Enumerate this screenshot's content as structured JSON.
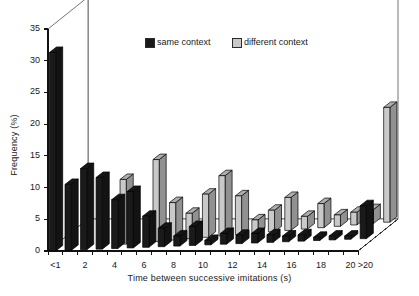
{
  "chart_data": {
    "type": "bar",
    "title": "",
    "xlabel": "Time between successive imitations (s)",
    "ylabel": "Frequency (%)",
    "ylim": [
      0,
      35
    ],
    "yticks": [
      0,
      5,
      10,
      15,
      20,
      25,
      30,
      35
    ],
    "xtick_labels": [
      "<1",
      "2",
      "4",
      "6",
      "8",
      "10",
      "12",
      "14",
      "16",
      "18",
      "20",
      ">20"
    ],
    "xtick_bins": [
      0,
      2,
      4,
      6,
      8,
      10,
      12,
      14,
      16,
      18,
      20,
      21
    ],
    "grid": false,
    "legend_position": "top-center",
    "style": "3d-grouped-bars",
    "categories": [
      "<1",
      "1-2",
      "2-3",
      "3-4",
      "4-5",
      "5-6",
      "6-7",
      "7-8",
      "8-9",
      "9-10",
      "10-11",
      "11-12",
      "12-13",
      "13-14",
      "14-15",
      "15-16",
      "16-17",
      "17-18",
      "18-19",
      "19-20",
      ">20"
    ],
    "series": [
      {
        "name": "same context",
        "color": "#1a1a1a",
        "values": [
          31.3,
          10.4,
          12.8,
          11.3,
          7.7,
          8.9,
          4.9,
          2.9,
          1.6,
          3.0,
          0.7,
          1.7,
          1.3,
          1.5,
          1.2,
          0.9,
          1.0,
          0.5,
          0.6,
          0.5,
          5.2
        ]
      },
      {
        "name": "different context",
        "color": "#c9c9c9",
        "values": [
          0.0,
          0.0,
          0.0,
          0.0,
          10.2,
          0.0,
          12.9,
          5.9,
          4.0,
          6.8,
          9.5,
          6.1,
          2.1,
          3.4,
          5.2,
          2.0,
          3.8,
          1.8,
          2.0,
          2.2,
          18.1
        ]
      }
    ]
  },
  "legend": {
    "entries": [
      {
        "label": "same context",
        "color": "#1a1a1a"
      },
      {
        "label": "different context",
        "color": "#c9c9c9"
      }
    ]
  }
}
